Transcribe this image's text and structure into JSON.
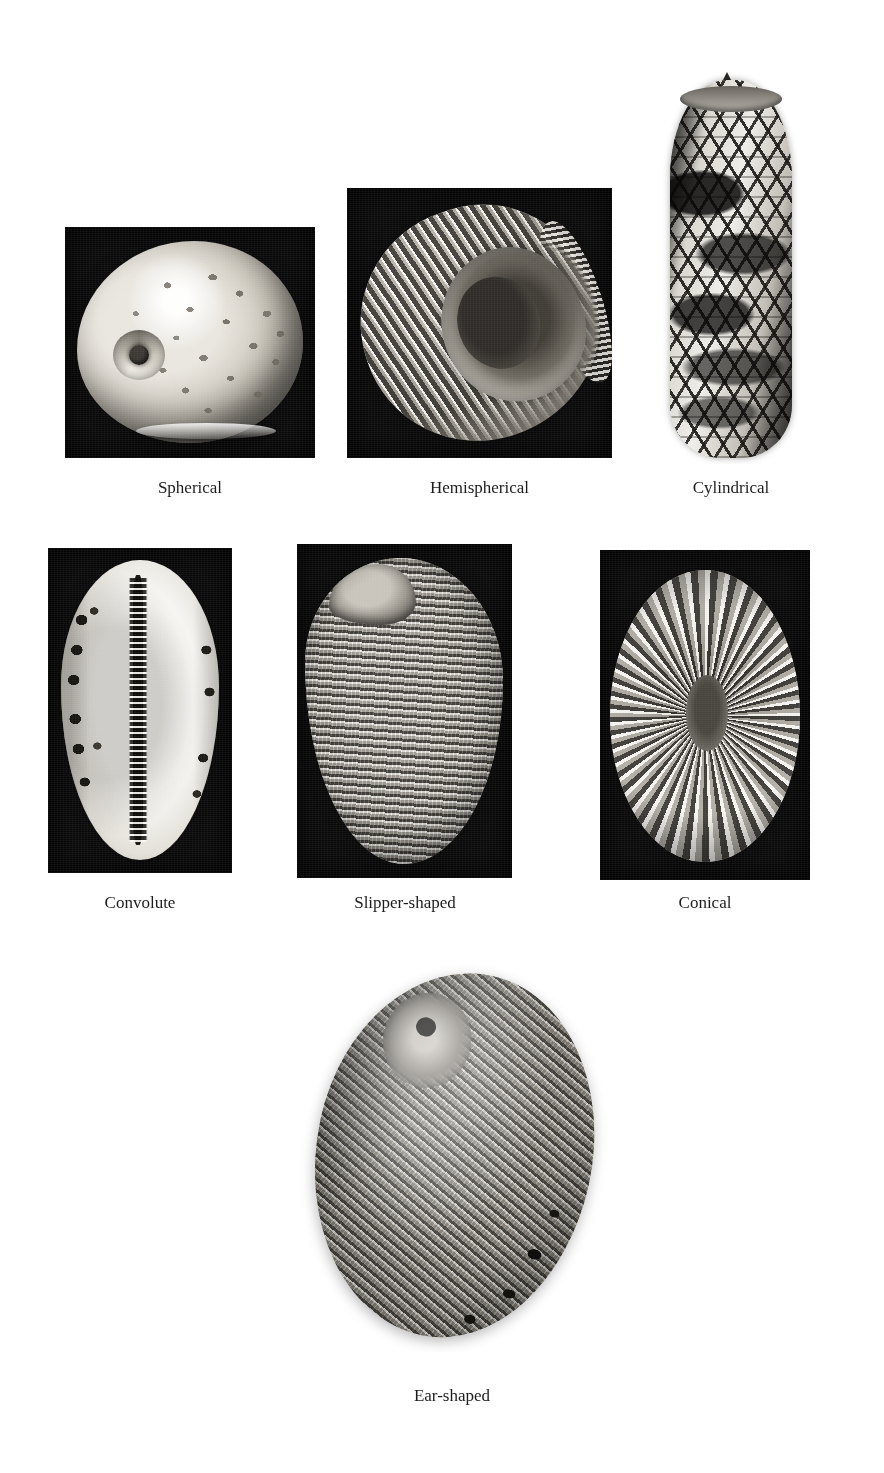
{
  "page": {
    "background_color": "#ffffff",
    "width": 884,
    "height": 1473,
    "top_clipped_header": ""
  },
  "figure": {
    "kind": "photographic plate grid",
    "caption_font_color": "#1c1c1c",
    "rows": 3,
    "columns": 3
  },
  "specimens": [
    {
      "id": "spherical",
      "caption": "Spherical",
      "subject": "moon-snail-shell",
      "background": "dark",
      "background_color": "#0b0b0b",
      "position": {
        "left": 65,
        "top": 227,
        "width": 250,
        "height": 231
      },
      "caption_box": {
        "left": 65,
        "top": 478,
        "width": 250
      }
    },
    {
      "id": "hemispherical",
      "caption": "Hemispherical",
      "subject": "ribbed-nerite-shell",
      "background": "dark",
      "background_color": "#0b0b0b",
      "position": {
        "left": 347,
        "top": 188,
        "width": 265,
        "height": 270
      },
      "caption_box": {
        "left": 347,
        "top": 478,
        "width": 265
      }
    },
    {
      "id": "cylindrical",
      "caption": "Cylindrical",
      "subject": "cone-shell",
      "background": "light",
      "background_color": "#ffffff",
      "position": {
        "left": 660,
        "top": 72,
        "width": 142,
        "height": 392
      },
      "caption_box": {
        "left": 625,
        "top": 478,
        "width": 212
      }
    },
    {
      "id": "convolute",
      "caption": "Convolute",
      "subject": "cowrie-shell-ventral",
      "background": "dark",
      "background_color": "#0b0b0b",
      "position": {
        "left": 48,
        "top": 548,
        "width": 184,
        "height": 325
      },
      "caption_box": {
        "left": 40,
        "top": 893,
        "width": 200
      }
    },
    {
      "id": "slipper-shaped",
      "caption": "Slipper-shaped",
      "subject": "slipper-limpet-shell",
      "background": "dark",
      "background_color": "#0b0b0b",
      "position": {
        "left": 297,
        "top": 544,
        "width": 215,
        "height": 334
      },
      "caption_box": {
        "left": 290,
        "top": 893,
        "width": 230
      }
    },
    {
      "id": "conical",
      "caption": "Conical",
      "subject": "limpet-shell-dorsal",
      "background": "dark",
      "background_color": "#0b0b0b",
      "position": {
        "left": 600,
        "top": 550,
        "width": 210,
        "height": 330
      },
      "caption_box": {
        "left": 600,
        "top": 893,
        "width": 210
      }
    },
    {
      "id": "ear-shaped",
      "caption": "Ear-shaped",
      "subject": "abalone-shell",
      "background": "light",
      "background_color": "#ffffff",
      "position": {
        "left": 296,
        "top": 962,
        "width": 312,
        "height": 390
      },
      "caption_box": {
        "left": 296,
        "top": 1386,
        "width": 312
      }
    }
  ]
}
